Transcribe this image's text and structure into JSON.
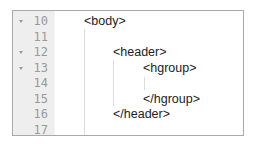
{
  "editor": {
    "colors": {
      "gutter_bg": "#eeeeee",
      "line_number": "#9a9a9a",
      "text": "#222222",
      "border": "#a9a9a9",
      "indent_guide": "#dcdcdc"
    },
    "lines": [
      {
        "number": "10",
        "foldable": true,
        "indent": 0,
        "code": "<body>"
      },
      {
        "number": "11",
        "foldable": false,
        "indent": 0,
        "code": ""
      },
      {
        "number": "12",
        "foldable": true,
        "indent": 1,
        "code": "<header>"
      },
      {
        "number": "13",
        "foldable": true,
        "indent": 2,
        "code": "<hgroup>"
      },
      {
        "number": "14",
        "foldable": false,
        "indent": 2,
        "code": ""
      },
      {
        "number": "15",
        "foldable": false,
        "indent": 2,
        "code": "</hgroup>"
      },
      {
        "number": "16",
        "foldable": false,
        "indent": 1,
        "code": "</header>"
      },
      {
        "number": "17",
        "foldable": false,
        "indent": 0,
        "code": ""
      }
    ]
  }
}
